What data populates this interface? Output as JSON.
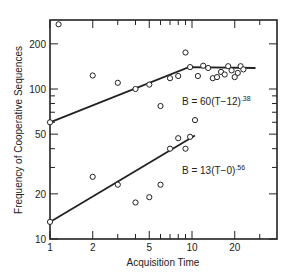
{
  "chart_data": {
    "type": "scatter",
    "title": "",
    "xlabel": "Acquisition Time",
    "ylabel": "Frequency of Cooperative Sequences",
    "xscale": "log",
    "yscale": "log",
    "xlim": [
      1,
      35
    ],
    "ylim": [
      10,
      270
    ],
    "grid": false,
    "legend": null,
    "x_ticks": [
      {
        "value": 1,
        "label": "1"
      },
      {
        "value": 2,
        "label": "2"
      },
      {
        "value": 3,
        "label": ""
      },
      {
        "value": 4,
        "label": ""
      },
      {
        "value": 5,
        "label": "5"
      },
      {
        "value": 6,
        "label": ""
      },
      {
        "value": 7,
        "label": ""
      },
      {
        "value": 8,
        "label": ""
      },
      {
        "value": 9,
        "label": ""
      },
      {
        "value": 10,
        "label": "10"
      },
      {
        "value": 20,
        "label": "20"
      },
      {
        "value": 30,
        "label": ""
      }
    ],
    "y_ticks": [
      {
        "value": 10,
        "label": "10"
      },
      {
        "value": 20,
        "label": "20"
      },
      {
        "value": 30,
        "label": ""
      },
      {
        "value": 40,
        "label": ""
      },
      {
        "value": 50,
        "label": "50"
      },
      {
        "value": 60,
        "label": ""
      },
      {
        "value": 70,
        "label": ""
      },
      {
        "value": 80,
        "label": ""
      },
      {
        "value": 90,
        "label": ""
      },
      {
        "value": 100,
        "label": "100"
      },
      {
        "value": 200,
        "label": "200"
      }
    ],
    "series": [
      {
        "name": "upper",
        "marker": "open-circle",
        "points": [
          [
            1.0,
            60
          ],
          [
            1.15,
            270
          ],
          [
            2.0,
            123
          ],
          [
            3.0,
            110
          ],
          [
            4.0,
            100
          ],
          [
            5.0,
            107
          ],
          [
            6.0,
            77
          ],
          [
            7.0,
            118
          ],
          [
            8.0,
            122
          ],
          [
            9.0,
            175
          ],
          [
            9.7,
            140
          ],
          [
            12.0,
            143
          ],
          [
            11.0,
            122
          ],
          [
            13.0,
            138
          ],
          [
            14.0,
            118
          ],
          [
            15.0,
            120
          ],
          [
            16.0,
            130
          ],
          [
            17.0,
            125
          ],
          [
            18.0,
            142
          ],
          [
            19.0,
            133
          ],
          [
            20.0,
            120
          ],
          [
            21.0,
            128
          ],
          [
            22.0,
            142
          ],
          [
            23.0,
            135
          ]
        ],
        "fit": {
          "label": "B = 60(T−12)",
          "exponent": ".38",
          "segments": [
            [
              1,
              60
            ],
            [
              9.5,
              140
            ],
            [
              28,
              138
            ]
          ]
        }
      },
      {
        "name": "lower",
        "marker": "open-circle",
        "points": [
          [
            1.0,
            13
          ],
          [
            2.0,
            26
          ],
          [
            3.0,
            23
          ],
          [
            4.0,
            17.5
          ],
          [
            5.0,
            19
          ],
          [
            6.0,
            23
          ],
          [
            7.0,
            40
          ],
          [
            8.0,
            47
          ],
          [
            9.0,
            40
          ],
          [
            9.7,
            48
          ],
          [
            10.5,
            62
          ]
        ],
        "fit": {
          "label": "B = 13(T−0)",
          "exponent": ".56",
          "segments": [
            [
              1,
              13
            ],
            [
              10.5,
              49
            ]
          ]
        }
      }
    ],
    "annotations": [
      {
        "text": "B = 60(T−12)",
        "sup": ".38",
        "x": 8.5,
        "y": 78
      },
      {
        "text": "B = 13(T−0)",
        "sup": ".56",
        "x": 8.5,
        "y": 27
      }
    ]
  },
  "labels": {
    "xlabel": "Acquisition Time",
    "ylabel": "Frequency of Cooperative Sequences",
    "eq_upper": "B = 60(T−12)",
    "eq_upper_sup": ".38",
    "eq_lower": "B = 13(T−0)",
    "eq_lower_sup": ".56"
  }
}
